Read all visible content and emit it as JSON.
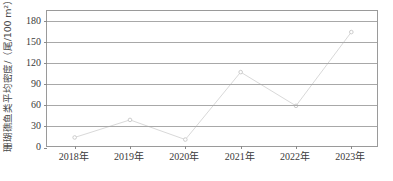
{
  "chart_data": {
    "type": "line",
    "title": "",
    "xlabel": "",
    "ylabel": "珊瑚礁鱼类平均密度/（尾/100 m²）",
    "categories": [
      "2018年",
      "2019年",
      "2020年",
      "2021年",
      "2022年",
      "2023年"
    ],
    "values": [
      15,
      40,
      12,
      108,
      60,
      165
    ],
    "series": [
      {
        "name": "珊瑚礁鱼类平均密度",
        "values": [
          15,
          40,
          12,
          108,
          60,
          165
        ]
      }
    ],
    "ylim": [
      0,
      195
    ],
    "yticks": [
      0,
      30,
      60,
      90,
      120,
      150,
      180
    ],
    "ytick_labels": [
      "0",
      "30",
      "60",
      "90",
      "120",
      "150",
      "180"
    ],
    "grid": true,
    "legend": false,
    "legend_position": "none",
    "line_color": "#d9d9d9",
    "marker_color": "#cccccc",
    "axis_color": "#9a9a9a",
    "gridline_color": "#a8a8a8"
  }
}
